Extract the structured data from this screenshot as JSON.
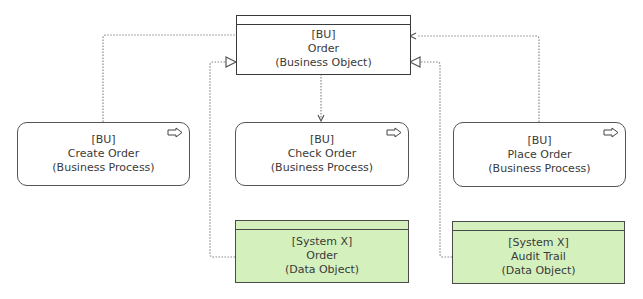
{
  "diagram": {
    "nodes": {
      "order_object": {
        "owner": "[BU]",
        "name": "Order",
        "type": "(Business Object)"
      },
      "create_order": {
        "owner": "[BU]",
        "name": "Create Order",
        "type": "(Business Process)"
      },
      "check_order": {
        "owner": "[BU]",
        "name": "Check Order",
        "type": "(Business Process)"
      },
      "place_order": {
        "owner": "[BU]",
        "name": "Place Order",
        "type": "(Business Process)"
      },
      "order_data": {
        "owner": "[System X]",
        "name": "Order",
        "type": "(Data Object)"
      },
      "audit_trail": {
        "owner": "[System X]",
        "name": "Audit Trail",
        "type": "(Data Object)"
      }
    },
    "edges": [
      {
        "from": "create_order",
        "to": "order_object",
        "style": "dotted",
        "head": "none"
      },
      {
        "from": "order_data",
        "to": "order_object",
        "style": "dotted",
        "head": "open-triangle"
      },
      {
        "from": "order_object",
        "to": "check_order",
        "style": "dotted",
        "head": "open-arrow"
      },
      {
        "from": "place_order",
        "to": "order_object",
        "style": "dotted",
        "head": "open-arrow"
      },
      {
        "from": "audit_trail",
        "to": "order_object",
        "style": "dotted",
        "head": "open-triangle"
      }
    ],
    "colors": {
      "data_object_fill": "#d4f0bd",
      "border": "#3a3a3a",
      "connector": "#888888"
    }
  }
}
